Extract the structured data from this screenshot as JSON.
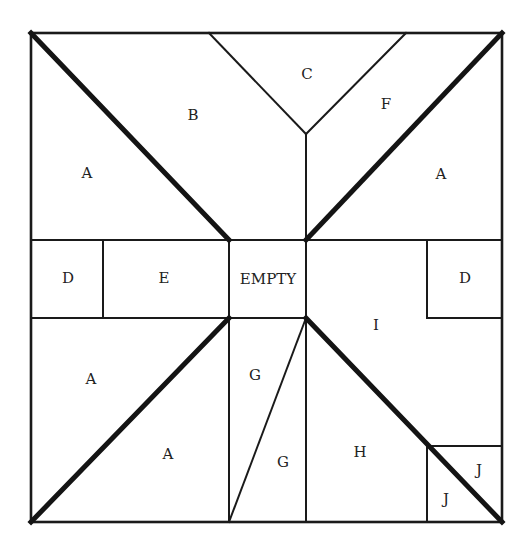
{
  "diagram": {
    "type": "tangram-style square puzzle",
    "frame": {
      "x": 31,
      "y": 33,
      "width": 471,
      "height": 489
    },
    "colors": {
      "line": "#1a1a1a",
      "background": "#ffffff",
      "text": "#222222"
    },
    "labels": {
      "a_top_left": "A",
      "b": "B",
      "c": "C",
      "f": "F",
      "a_top_right": "A",
      "d_left": "D",
      "e": "E",
      "empty": "EMPTY",
      "d_right": "D",
      "i": "I",
      "a_bottom_left_upper": "A",
      "a_bottom_left_lower": "A",
      "g_upper": "G",
      "g_lower": "G",
      "h": "H",
      "j_upper": "J",
      "j_lower": "J"
    }
  }
}
